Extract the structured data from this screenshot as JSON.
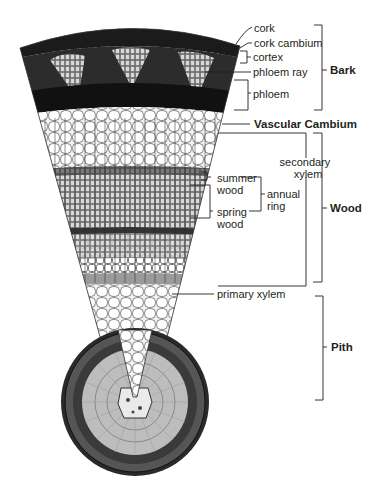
{
  "diagram": {
    "labels": {
      "cork": "cork",
      "cork_cambium": "cork cambium",
      "cortex": "cortex",
      "phloem_ray": "phloem ray",
      "phloem": "phloem",
      "vascular_cambium": "Vascular Cambium",
      "secondary_xylem_1": "secondary",
      "secondary_xylem_2": "xylem",
      "summer_wood_1": "summer",
      "summer_wood_2": "wood",
      "spring_wood_1": "spring",
      "spring_wood_2": "wood",
      "annual_ring_1": "annual",
      "annual_ring_2": "ring",
      "primary_xylem": "primary xylem"
    },
    "groups": {
      "bark": "Bark",
      "wood": "Wood",
      "pith": "Pith"
    },
    "colors": {
      "ink": "#231f20",
      "dark_tissue": "#1a1a1a",
      "mid_tissue": "#7a7a7a",
      "light_tissue": "#e6e6e6",
      "background": "#ffffff"
    }
  }
}
